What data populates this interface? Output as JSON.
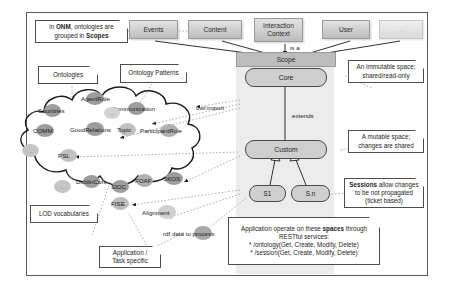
{
  "diagram": {
    "title_terms": {
      "onm": "ONM",
      "scopes": "Scopes",
      "spaces": "spaces",
      "sessions": "Sessions"
    },
    "top_classes": [
      {
        "id": "events",
        "label": "Events"
      },
      {
        "id": "content",
        "label": "Content"
      },
      {
        "id": "interaction-context",
        "label": "Interaction\nContext"
      },
      {
        "id": "user",
        "label": "User"
      },
      {
        "id": "more",
        "label": "..."
      }
    ],
    "scope_bar": {
      "label": "Scope"
    },
    "spaces": [
      {
        "id": "core",
        "label": "Core"
      },
      {
        "id": "custom",
        "label": "Custom"
      },
      {
        "id": "s1",
        "label": "S1"
      },
      {
        "id": "sn",
        "label": "S.n"
      }
    ],
    "edge_labels": {
      "is_a": "is a",
      "extends": "extends",
      "owl_import": "owl:import",
      "rdf_data": "rdf data to process"
    },
    "notes": [
      {
        "id": "onm-note",
        "line1_pre": "in ",
        "line1_bold": "ONM",
        "line1_post": ", ontologies are",
        "line2_pre": "grouped in ",
        "line2_bold": "Scopes",
        "line2_post": ""
      },
      {
        "id": "ontologies-note",
        "text": "Ontologies"
      },
      {
        "id": "ontology-patterns-note",
        "text": "Ontology Patterns"
      },
      {
        "id": "lod-note",
        "text": "LOD vocabularies"
      },
      {
        "id": "application-task-note",
        "line1": "Application /",
        "line2": "Task specific"
      },
      {
        "id": "immutable-note",
        "line1": "An immutable space;",
        "line2": "shared/read-only"
      },
      {
        "id": "mutable-note",
        "line1": "A mutable space;",
        "line2": "changes are shared"
      },
      {
        "id": "sessions-note",
        "line1_bold": "Sessions",
        "line1_post": " allow changes",
        "line2": "to be not propagated",
        "line3": "(ticket based)"
      },
      {
        "id": "restful-note",
        "line1_pre": "Application operate on these ",
        "line1_bold": "spaces",
        "line1_post": " through",
        "line2": "RESTful services:",
        "line3": "* /ontology(Get, Create, Modify, Delete)",
        "line4": "* /session(Get, Create, Modify, Delete)"
      }
    ],
    "cloud_vocabularies": [
      {
        "id": "agentrole",
        "label": "AgentRole"
      },
      {
        "id": "countries",
        "label": "Countries"
      },
      {
        "id": "communication",
        "label": "Communication"
      },
      {
        "id": "comm",
        "label": "COMM"
      },
      {
        "id": "goodrelations",
        "label": "GoodRelations"
      },
      {
        "id": "topic",
        "label": "Topic"
      },
      {
        "id": "participantrole",
        "label": "ParticipantRole"
      },
      {
        "id": "psl",
        "label": "PSL"
      },
      {
        "id": "dublincore",
        "label": "DublinCore"
      },
      {
        "id": "sioc",
        "label": "SIOC"
      },
      {
        "id": "foaf",
        "label": "FOAF"
      },
      {
        "id": "skos",
        "label": "SKOS"
      },
      {
        "id": "ellipsis1",
        "label": "..."
      },
      {
        "id": "ellipsis2",
        "label": "..."
      },
      {
        "id": "ellipsis3",
        "label": "..."
      }
    ],
    "outside_vocabularies": [
      {
        "id": "fise",
        "label": "FISE"
      },
      {
        "id": "alignment",
        "label": "Alignment"
      },
      {
        "id": "rdf-data",
        "label": "rdf data to process"
      }
    ],
    "colors": {
      "gray_box": "#bdbdbd",
      "band": "#ececec",
      "capsule": "#cfcfcf",
      "ellipse": "#b5b5b5",
      "frame": "#5a5a5a"
    }
  }
}
